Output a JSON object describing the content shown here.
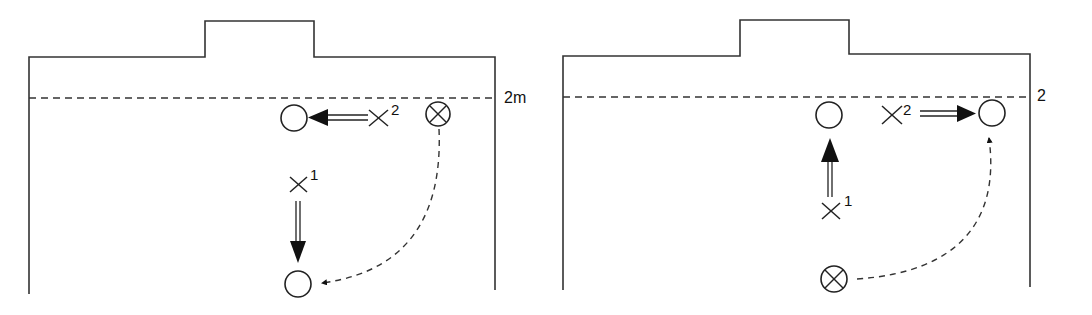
{
  "diagram": {
    "type": "handball court drill diagrams",
    "panels": [
      {
        "id": "left",
        "distance_label": "2m",
        "players": [
          {
            "symbol": "X",
            "number": "1"
          },
          {
            "symbol": "X",
            "number": "2"
          }
        ],
        "ball_carrier_symbol": "⊗",
        "legend": {
          "x_marker": "attacker",
          "circle_marker": "target position",
          "circled_x_marker": "starting player with ball",
          "double_arrow": "player movement",
          "dashed_arrow": "pass"
        }
      },
      {
        "id": "right",
        "distance_label": "2",
        "players": [
          {
            "symbol": "X",
            "number": "1"
          },
          {
            "symbol": "X",
            "number": "2"
          }
        ],
        "ball_carrier_symbol": "⊗"
      }
    ]
  }
}
